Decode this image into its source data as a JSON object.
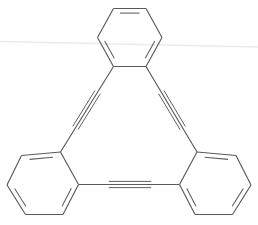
{
  "figure": {
    "background_color": "#ffffff",
    "bond_color": "#595959",
    "artifact_color": "#eceaea",
    "width": 258,
    "height": 225
  },
  "chart_data": {
    "type": "diagram",
    "xlabel": "",
    "ylabel": "",
    "rings": [
      {
        "name": "top-benzene-ring",
        "orientation": "pointy-left-right",
        "vertices": [
          [
            113.5,
            8.5
          ],
          [
            146.0,
            8.5
          ],
          [
            162.0,
            37.5
          ],
          [
            146.0,
            66.5
          ],
          [
            113.5,
            66.5
          ],
          [
            97.5,
            37.5
          ]
        ],
        "double_bond_edges": [
          0,
          2,
          4
        ]
      },
      {
        "name": "bottom-left-benzene-ring",
        "orientation": "pointy-left-right",
        "vertices": [
          [
            21.5,
            155.5
          ],
          [
            60.5,
            152.0
          ],
          [
            78.5,
            184.5
          ],
          [
            63.0,
            214.5
          ],
          [
            25.5,
            214.5
          ],
          [
            7.0,
            185.0
          ]
        ],
        "double_bond_edges": [
          0,
          2,
          4
        ]
      },
      {
        "name": "bottom-right-benzene-ring",
        "orientation": "pointy-left-right",
        "vertices": [
          [
            197.0,
            152.0
          ],
          [
            236.0,
            155.5
          ],
          [
            251.0,
            185.0
          ],
          [
            232.5,
            214.5
          ],
          [
            195.0,
            214.5
          ],
          [
            179.5,
            184.5
          ]
        ],
        "double_bond_edges": [
          0,
          2,
          4
        ]
      }
    ],
    "triple_bonds": [
      {
        "name": "left-alkyne",
        "from": [
          113.5,
          66.5
        ],
        "to": [
          60.5,
          152.0
        ],
        "label": "C#C"
      },
      {
        "name": "right-alkyne",
        "from": [
          146.0,
          66.5
        ],
        "to": [
          197.0,
          152.0
        ],
        "label": "C#C"
      },
      {
        "name": "bottom-alkyne",
        "from": [
          78.5,
          184.5
        ],
        "to": [
          179.5,
          184.5
        ],
        "label": "C#C"
      }
    ],
    "artifacts": [
      {
        "name": "scan-streak",
        "from": [
          0,
          41.5
        ],
        "to": [
          258,
          47.0
        ]
      }
    ]
  }
}
